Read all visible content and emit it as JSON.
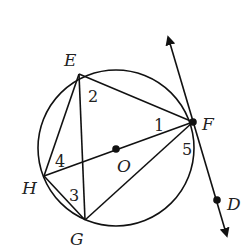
{
  "diagram": {
    "type": "circle-geometry",
    "circle": {
      "center_label": "O",
      "cx": 116,
      "cy": 148,
      "r": 78
    },
    "points": [
      {
        "id": "E",
        "label": "E",
        "x": 79,
        "y": 74,
        "lx": 64,
        "ly": 66
      },
      {
        "id": "F",
        "label": "F",
        "x": 193,
        "y": 122,
        "lx": 202,
        "ly": 130
      },
      {
        "id": "H",
        "label": "H",
        "x": 44,
        "y": 176,
        "lx": 22,
        "ly": 194
      },
      {
        "id": "G",
        "label": "G",
        "x": 85,
        "y": 220,
        "lx": 70,
        "ly": 245
      },
      {
        "id": "O",
        "label": "O",
        "x": 116,
        "y": 149,
        "lx": 117,
        "ly": 172
      },
      {
        "id": "D",
        "label": "D",
        "x": 217,
        "y": 200,
        "lx": 227,
        "ly": 210
      }
    ],
    "segments": [
      [
        "E",
        "F"
      ],
      [
        "E",
        "H"
      ],
      [
        "E",
        "G"
      ],
      [
        "H",
        "G"
      ],
      [
        "H",
        "F"
      ],
      [
        "G",
        "F"
      ]
    ],
    "tangent_line": {
      "label": "line FD (tangent at F)",
      "x1": 169,
      "y1": 40,
      "x2": 226,
      "y2": 233
    },
    "angle_labels": [
      {
        "text": "1",
        "x": 154,
        "y": 131
      },
      {
        "text": "2",
        "x": 88,
        "y": 102
      },
      {
        "text": "3",
        "x": 69,
        "y": 201
      },
      {
        "text": "4",
        "x": 55,
        "y": 167
      },
      {
        "text": "5",
        "x": 182,
        "y": 155
      }
    ],
    "colors": {
      "stroke": "#111111",
      "text": "#222222",
      "background": "#ffffff"
    }
  }
}
